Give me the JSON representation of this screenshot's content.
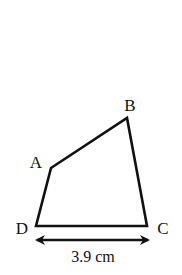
{
  "figure": {
    "type": "quadrilateral",
    "vertices": [
      {
        "name": "A",
        "label": "A",
        "x": 51,
        "y": 168,
        "label_x": 42,
        "label_y": 168
      },
      {
        "name": "B",
        "label": "B",
        "x": 127,
        "y": 118,
        "label_x": 130,
        "label_y": 111
      },
      {
        "name": "C",
        "label": "C",
        "x": 147,
        "y": 226,
        "label_x": 163,
        "label_y": 234
      },
      {
        "name": "D",
        "label": "D",
        "x": 36,
        "y": 226,
        "label_x": 22,
        "label_y": 234
      }
    ],
    "dimension": {
      "segment": "DC",
      "text": "3.9 cm",
      "arrow_y": 240,
      "x1": 34,
      "x2": 151,
      "text_x": 93,
      "text_y": 262
    },
    "line_color": "#111111",
    "background_color": "#ffffff"
  }
}
